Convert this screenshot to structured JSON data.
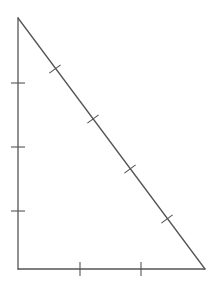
{
  "diagram": {
    "type": "right-triangle-with-tick-marks",
    "stroke_color": "#555555",
    "background": "#ffffff",
    "vertices": {
      "top": [
        18,
        18
      ],
      "right_angle": [
        18,
        269
      ],
      "bottom_right": [
        205,
        269
      ]
    },
    "sides": [
      {
        "name": "vertical-leg",
        "tick_count": 3,
        "ticks": [
          [
            18,
            83
          ],
          [
            18,
            147
          ],
          [
            18,
            211
          ]
        ]
      },
      {
        "name": "horizontal-leg",
        "tick_count": 2,
        "ticks": [
          [
            80,
            269
          ],
          [
            141,
            269
          ]
        ]
      },
      {
        "name": "hypotenuse",
        "tick_count": 4,
        "ticks": [
          [
            55,
            69
          ],
          [
            93,
            119
          ],
          [
            130,
            169
          ],
          [
            167,
            219
          ]
        ]
      }
    ],
    "tick_half_length": 7
  }
}
